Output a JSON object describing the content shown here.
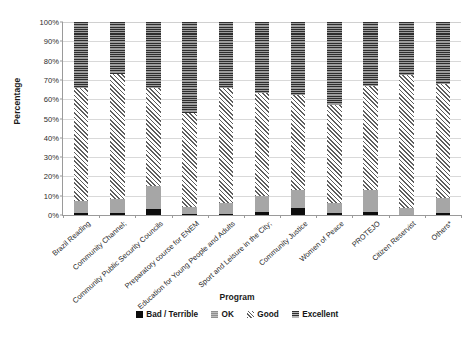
{
  "chart_data": {
    "type": "bar",
    "stacked": true,
    "stack_mode": "percent",
    "title": "",
    "xlabel": "Program",
    "ylabel": "Percentage",
    "ylim": [
      0,
      100
    ],
    "y_ticks": [
      "0%",
      "10%",
      "20%",
      "30%",
      "40%",
      "50%",
      "60%",
      "70%",
      "80%",
      "90%",
      "100%"
    ],
    "y_tick_values": [
      0,
      10,
      20,
      30,
      40,
      50,
      60,
      70,
      80,
      90,
      100
    ],
    "grid": true,
    "legend_position": "bottom",
    "categories": [
      "Brazil Reading",
      "Community Channel;",
      "Community Public Security Councils",
      "Preparatory course for ENEM",
      "Education for Young People and Adults",
      "Sport and Leisure in the City;",
      "Community Justice",
      "Women of Peace",
      "PROTEJO",
      "Citizen Reservist",
      "Others*"
    ],
    "series": [
      {
        "name": "Bad / Terrible",
        "color": "#0d0d0d",
        "pattern": "solid",
        "values": [
          1.0,
          0.8,
          3.0,
          0.6,
          0.7,
          1.8,
          3.5,
          1.0,
          1.5,
          0.0,
          0.8
        ]
      },
      {
        "name": "OK",
        "color": "#a6a6a6",
        "pattern": "light-solid",
        "values": [
          6.5,
          7.4,
          12.0,
          3.6,
          5.5,
          8.0,
          9.5,
          5.2,
          11.5,
          3.5,
          8.2
        ]
      },
      {
        "name": "Good",
        "color": "#5e5e5e",
        "pattern": "diagonal-hatch",
        "values": [
          58.5,
          64.8,
          51.0,
          48.8,
          59.8,
          53.2,
          49.0,
          50.8,
          54.0,
          69.0,
          59.0
        ]
      },
      {
        "name": "Excellent",
        "color": "#6e6e6e",
        "pattern": "horizontal-lines",
        "values": [
          34.0,
          27.0,
          34.0,
          47.0,
          34.0,
          37.0,
          38.0,
          43.0,
          33.0,
          27.5,
          32.0
        ]
      }
    ],
    "segment_tops": {
      "note": "cumulative stack tops in percent, per category",
      "bad_top": [
        1.0,
        0.8,
        3.0,
        0.6,
        0.7,
        1.8,
        3.5,
        1.0,
        1.5,
        0.0,
        0.8
      ],
      "ok_top": [
        7.5,
        8.2,
        15.0,
        4.2,
        6.2,
        9.8,
        13.0,
        6.2,
        13.0,
        3.5,
        9.0
      ],
      "good_top": [
        66.0,
        73.0,
        66.0,
        53.0,
        66.0,
        63.0,
        62.0,
        57.0,
        67.0,
        72.5,
        68.0
      ],
      "excellent_top": [
        100,
        100,
        100,
        100,
        100,
        100,
        100,
        100,
        100,
        100,
        100
      ]
    }
  },
  "legend": {
    "items": [
      {
        "label": "Bad / Terrible",
        "swatch": "bad-swatch"
      },
      {
        "label": "OK",
        "swatch": "ok-swatch"
      },
      {
        "label": "Good",
        "swatch": "good-swatch"
      },
      {
        "label": "Excellent",
        "swatch": "excellent-swatch"
      }
    ]
  },
  "axes": {
    "y_title": "Percentage",
    "x_title": "Program"
  }
}
